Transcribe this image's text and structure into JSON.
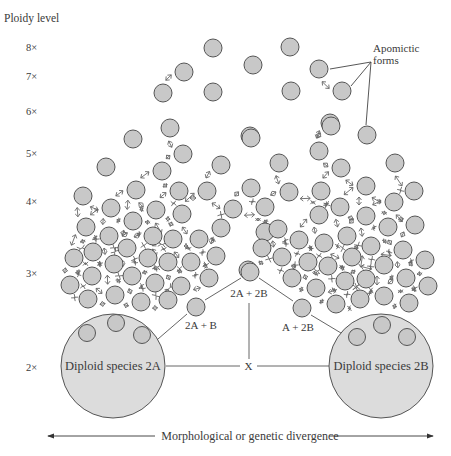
{
  "figure": {
    "axis_title": "Ploidy level",
    "ploidy_levels": [
      {
        "label": "8×",
        "y": 47
      },
      {
        "label": "7×",
        "y": 76
      },
      {
        "label": "6×",
        "y": 111
      },
      {
        "label": "5×",
        "y": 153
      },
      {
        "label": "4×",
        "y": 201
      },
      {
        "label": "3×",
        "y": 273
      },
      {
        "label": "2×",
        "y": 367
      }
    ],
    "apomictic_label_line1": "Apomictic",
    "apomictic_label_line2": "forms",
    "species_left": {
      "label": "Diploid species 2A",
      "cx": 113,
      "cy": 366,
      "r": 52
    },
    "species_right": {
      "label": "Diploid species 2B",
      "cx": 381,
      "cy": 366,
      "r": 52
    },
    "hybrid_labels": {
      "left": "2A + B",
      "center": "2A + 2B",
      "right": "A + 2B",
      "cross": "X"
    },
    "x_axis_label": "Morphological or genetic divergence",
    "colors": {
      "circle_fill": "#c8c8c8",
      "big_circle_fill": "#dcdcdc",
      "stroke": "#555555",
      "text": "#3a3a3a"
    },
    "small_circles": [
      [
        213,
        48
      ],
      [
        253,
        65
      ],
      [
        290,
        47
      ],
      [
        184,
        72
      ],
      [
        213,
        92
      ],
      [
        291,
        91
      ],
      [
        319,
        69
      ],
      [
        342,
        91
      ],
      [
        163,
        93
      ],
      [
        170,
        128
      ],
      [
        250,
        136
      ],
      [
        330,
        123
      ],
      [
        367,
        135
      ],
      [
        133,
        139
      ],
      [
        183,
        154
      ],
      [
        106,
        167
      ],
      [
        162,
        171
      ],
      [
        221,
        165
      ],
      [
        251,
        138
      ],
      [
        136,
        190
      ],
      [
        179,
        191
      ],
      [
        207,
        191
      ],
      [
        251,
        188
      ],
      [
        83,
        196
      ],
      [
        111,
        208
      ],
      [
        156,
        210
      ],
      [
        182,
        214
      ],
      [
        233,
        209
      ],
      [
        331,
        126
      ],
      [
        319,
        151
      ],
      [
        279,
        163
      ],
      [
        341,
        168
      ],
      [
        395,
        163
      ],
      [
        366,
        186
      ],
      [
        414,
        191
      ],
      [
        289,
        192
      ],
      [
        321,
        191
      ],
      [
        394,
        202
      ],
      [
        265,
        207
      ],
      [
        340,
        207
      ],
      [
        86,
        227
      ],
      [
        109,
        236
      ],
      [
        133,
        221
      ],
      [
        153,
        236
      ],
      [
        173,
        239
      ],
      [
        199,
        239
      ],
      [
        221,
        228
      ],
      [
        93,
        252
      ],
      [
        127,
        248
      ],
      [
        148,
        258
      ],
      [
        168,
        262
      ],
      [
        191,
        262
      ],
      [
        216,
        256
      ],
      [
        74,
        258
      ],
      [
        114,
        264
      ],
      [
        92,
        276
      ],
      [
        132,
        276
      ],
      [
        155,
        283
      ],
      [
        181,
        286
      ],
      [
        209,
        278
      ],
      [
        70,
        285
      ],
      [
        88,
        299
      ],
      [
        115,
        295
      ],
      [
        141,
        302
      ],
      [
        168,
        300
      ],
      [
        248,
        270
      ],
      [
        265,
        232
      ],
      [
        319,
        215
      ],
      [
        366,
        216
      ],
      [
        415,
        225
      ],
      [
        278,
        229
      ],
      [
        299,
        240
      ],
      [
        324,
        243
      ],
      [
        347,
        236
      ],
      [
        371,
        246
      ],
      [
        388,
        227
      ],
      [
        403,
        250
      ],
      [
        425,
        260
      ],
      [
        262,
        248
      ],
      [
        282,
        257
      ],
      [
        308,
        262
      ],
      [
        328,
        266
      ],
      [
        352,
        257
      ],
      [
        384,
        265
      ],
      [
        406,
        278
      ],
      [
        428,
        286
      ],
      [
        292,
        278
      ],
      [
        316,
        288
      ],
      [
        345,
        281
      ],
      [
        366,
        279
      ],
      [
        384,
        296
      ],
      [
        409,
        303
      ],
      [
        336,
        304
      ],
      [
        360,
        299
      ]
    ],
    "apex_circles": [
      {
        "name": "2A+2B",
        "cx": 250,
        "cy": 272
      },
      {
        "name": "2A+B",
        "cx": 196,
        "cy": 307
      },
      {
        "name": "A+2B",
        "cx": 302,
        "cy": 308
      }
    ],
    "left_inner_circles": [
      [
        87,
        333
      ],
      [
        116,
        323
      ],
      [
        142,
        335
      ]
    ],
    "right_inner_circles": [
      [
        357,
        337
      ],
      [
        382,
        325
      ],
      [
        407,
        337
      ]
    ],
    "apomictic_targets": [
      [
        330,
        69
      ],
      [
        351,
        86
      ],
      [
        366,
        125
      ]
    ],
    "apomictic_anchor": [
      371,
      62
    ]
  }
}
